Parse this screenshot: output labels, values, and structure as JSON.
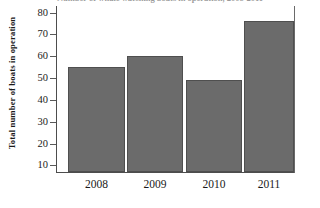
{
  "chart_data": {
    "type": "bar",
    "title": "Number of whale watching boats in operation, 2008-2011",
    "title_cropped": true,
    "xlabel": "",
    "ylabel": "Total number of boats in operation",
    "categories": [
      "2008",
      "2009",
      "2010",
      "2011"
    ],
    "values": [
      55,
      60,
      49,
      76
    ],
    "ylim": [
      7,
      83
    ],
    "yticks": [
      10,
      20,
      30,
      40,
      50,
      60,
      70,
      80
    ],
    "ytick_labels": [
      "10",
      "20",
      "30",
      "40",
      "50",
      "60",
      "70",
      "80"
    ],
    "grid": false,
    "legend": null,
    "bar_color": "#6b6b6b",
    "bar_edge_color": "#4f4f4f",
    "axis_color": "#4d4d4d",
    "text_color": "#1a1a1a",
    "background": "#ffffff"
  }
}
